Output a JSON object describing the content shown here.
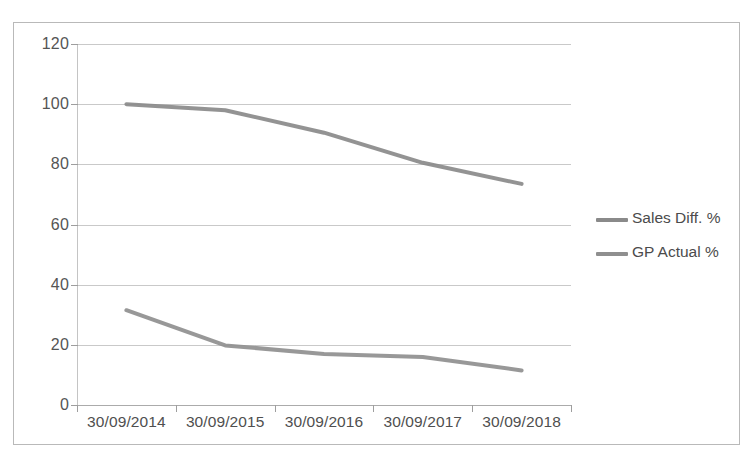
{
  "chart_data": {
    "type": "line",
    "title": "",
    "xlabel": "",
    "ylabel": "",
    "categories": [
      "30/09/2014",
      "30/09/2015",
      "30/09/2016",
      "30/09/2017",
      "30/09/2018"
    ],
    "series": [
      {
        "name": "Sales Diff. %",
        "values": [
          100,
          98,
          90.5,
          80.5,
          73.5
        ],
        "color": "#8a8a8a"
      },
      {
        "name": "GP Actual %",
        "values": [
          31.5,
          19.8,
          17,
          16,
          11.5
        ],
        "color": "#8f8f8f"
      }
    ],
    "ylim": [
      0,
      120
    ],
    "ytick_values": [
      120,
      100,
      80,
      60,
      40,
      20,
      0
    ],
    "ytick_labels": [
      "120",
      "100",
      "80",
      "60",
      "40",
      "20",
      "0"
    ],
    "grid": true,
    "legend_position": "right",
    "markers": false
  },
  "axes": {
    "y_labels": [
      "120",
      "100",
      "80",
      "60",
      "40",
      "20",
      "0"
    ],
    "x_labels": [
      "30/09/2014",
      "30/09/2015",
      "30/09/2016",
      "30/09/2017",
      "30/09/2018"
    ]
  },
  "legend": {
    "items": [
      {
        "label": "Sales Diff. %",
        "color": "#8a8a8a"
      },
      {
        "label": "GP Actual %",
        "color": "#8f8f8f"
      }
    ]
  },
  "colors": {
    "series_sales": "#8a8a8a",
    "series_gp": "#8f8f8f",
    "gridline": "#c9c9c9",
    "frame": "#b9b9b9",
    "text": "#4b4b4b"
  }
}
